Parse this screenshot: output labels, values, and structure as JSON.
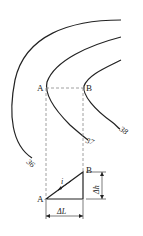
{
  "diagram": {
    "contours": [
      {
        "label": "36"
      },
      {
        "label": "37"
      },
      {
        "label": "38"
      }
    ],
    "points": {
      "a_upper": "A",
      "b_upper": "B",
      "a_lower": "A",
      "b_lower": "B"
    },
    "triangle": {
      "slope_label": "i",
      "rise_label": "Δh",
      "run_label": "ΔL"
    },
    "colors": {
      "line": "#222222",
      "dashed": "#888888"
    }
  }
}
